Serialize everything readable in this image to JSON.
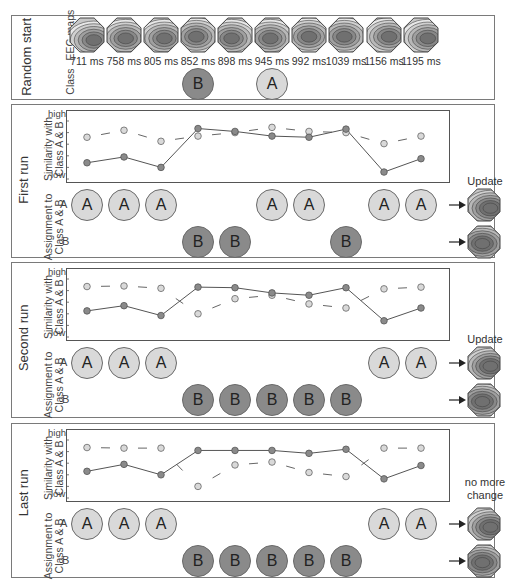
{
  "panels": {
    "random_start": {
      "title": "Random start",
      "row_labels": {
        "maps": "EEG maps",
        "class": "Class"
      },
      "maps": [
        {
          "time": "711 ms",
          "pattern": "pattern-1"
        },
        {
          "time": "758 ms",
          "pattern": "pattern-2"
        },
        {
          "time": "805 ms",
          "pattern": "pattern-3"
        },
        {
          "time": "852 ms",
          "pattern": "pattern-4"
        },
        {
          "time": "898 ms",
          "pattern": "pattern-5"
        },
        {
          "time": "945 ms",
          "pattern": "pattern-6"
        },
        {
          "time": "992 ms",
          "pattern": "pattern-7"
        },
        {
          "time": "1039 ms",
          "pattern": "pattern-8"
        },
        {
          "time": "1156 ms",
          "pattern": "pattern-9"
        },
        {
          "time": "1195 ms",
          "pattern": "pattern-10"
        }
      ],
      "class_assignments": [
        {
          "index": 3,
          "label": "B"
        },
        {
          "index": 5,
          "label": "A"
        }
      ]
    },
    "first_run": {
      "title": "First run",
      "chart_ylabel": "Similarity with Class A & B",
      "assign_label": "Assignment to Class A & B",
      "row_a": "A",
      "row_b": "B",
      "a_indices": [
        0,
        1,
        2,
        5,
        6,
        8,
        9
      ],
      "b_indices": [
        3,
        4,
        7
      ],
      "circle_a_text": "A",
      "circle_b_text": "B",
      "side_note": "Update"
    },
    "second_run": {
      "title": "Second run",
      "chart_ylabel": "Similarity with Class A & B",
      "assign_label": "Assignment to Class A & B",
      "row_a": "A",
      "row_b": "B",
      "a_indices": [
        0,
        1,
        2,
        8,
        9
      ],
      "b_indices": [
        3,
        4,
        5,
        6,
        7
      ],
      "circle_a_text": "A",
      "circle_b_text": "B",
      "side_note": "Update"
    },
    "last_run": {
      "title": "Last run",
      "chart_ylabel": "Similarity with Class A & B",
      "assign_label": "Assignment to Class A & B",
      "row_a": "A",
      "row_b": "B",
      "a_indices": [
        0,
        1,
        2,
        8,
        9
      ],
      "b_indices": [
        3,
        4,
        5,
        6,
        7
      ],
      "circle_a_text": "A",
      "circle_b_text": "B",
      "side_note": "no more change"
    }
  },
  "axis": {
    "high": "high",
    "low": "low"
  },
  "colors": {
    "class_a": "#d9d9d9",
    "class_b": "#8a8a8a",
    "border": "#7a7a7a",
    "line": "#555555"
  },
  "chart_data": [
    {
      "type": "line",
      "title": "First run",
      "ylabel": "Similarity with Class A & B",
      "yticks": [
        "low",
        "high"
      ],
      "ylim": [
        0,
        1
      ],
      "x": [
        "711 ms",
        "758 ms",
        "805 ms",
        "852 ms",
        "898 ms",
        "945 ms",
        "992 ms",
        "1039 ms",
        "1156 ms",
        "1195 ms"
      ],
      "series": [
        {
          "name": "Class A similarity (dashed, light)",
          "values": [
            0.72,
            0.84,
            0.65,
            0.74,
            0.8,
            0.89,
            0.82,
            0.8,
            0.61,
            0.74
          ]
        },
        {
          "name": "Class B similarity (solid, dark)",
          "values": [
            0.28,
            0.38,
            0.2,
            0.87,
            0.82,
            0.74,
            0.72,
            0.86,
            0.12,
            0.35
          ]
        }
      ]
    },
    {
      "type": "line",
      "title": "Second run",
      "ylabel": "Similarity with Class A & B",
      "yticks": [
        "low",
        "high"
      ],
      "ylim": [
        0,
        1
      ],
      "x": [
        "711 ms",
        "758 ms",
        "805 ms",
        "852 ms",
        "898 ms",
        "945 ms",
        "992 ms",
        "1039 ms",
        "1156 ms",
        "1195 ms"
      ],
      "series": [
        {
          "name": "Class A similarity (dashed, light)",
          "values": [
            0.87,
            0.88,
            0.84,
            0.4,
            0.66,
            0.72,
            0.57,
            0.5,
            0.83,
            0.86
          ]
        },
        {
          "name": "Class B similarity (solid, dark)",
          "values": [
            0.45,
            0.54,
            0.37,
            0.86,
            0.85,
            0.76,
            0.72,
            0.85,
            0.28,
            0.5
          ]
        }
      ]
    },
    {
      "type": "line",
      "title": "Last run",
      "ylabel": "Similarity with Class A & B",
      "yticks": [
        "low",
        "high"
      ],
      "ylim": [
        0,
        1
      ],
      "x": [
        "711 ms",
        "758 ms",
        "805 ms",
        "852 ms",
        "898 ms",
        "945 ms",
        "992 ms",
        "1039 ms",
        "1156 ms",
        "1195 ms"
      ],
      "series": [
        {
          "name": "Class A similarity (dashed, light)",
          "values": [
            0.87,
            0.86,
            0.86,
            0.2,
            0.57,
            0.62,
            0.44,
            0.37,
            0.86,
            0.86
          ]
        },
        {
          "name": "Class B similarity (solid, dark)",
          "values": [
            0.46,
            0.58,
            0.4,
            0.82,
            0.82,
            0.82,
            0.77,
            0.84,
            0.33,
            0.56
          ]
        }
      ]
    }
  ]
}
